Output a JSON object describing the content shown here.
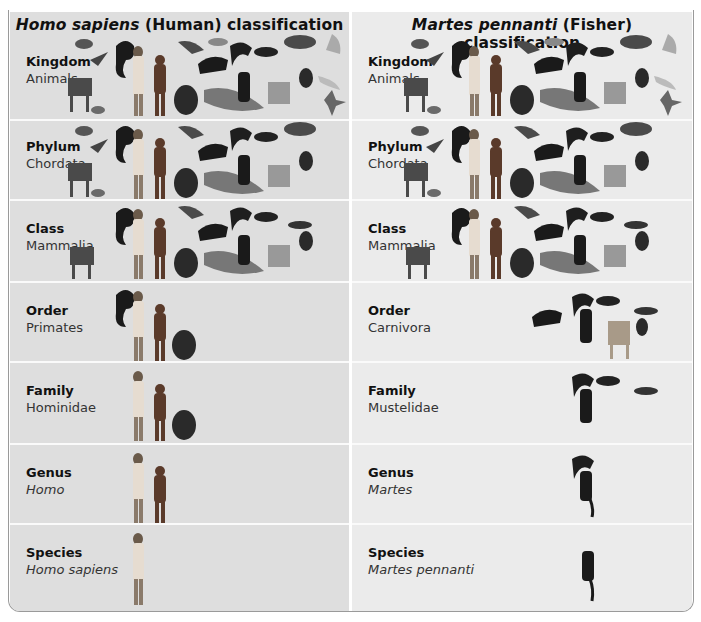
{
  "panels": [
    {
      "id": "human",
      "title_italic": "Homo sapiens",
      "title_rest": " (Human) classification",
      "background": "#dedede",
      "rows": [
        {
          "rank": "Kingdom",
          "taxon": "Animals",
          "taxon_italic": false,
          "organisms": [
            "bird",
            "gull",
            "primate-monkey",
            "human-man",
            "human-woman",
            "bat",
            "squirrel",
            "raccoon",
            "marten",
            "ferret",
            "fish",
            "jellyfish",
            "goat",
            "frog",
            "insect",
            "chimpanzee",
            "manatee",
            "fisher",
            "dog",
            "weasel",
            "cat",
            "snake",
            "starfish",
            "shell"
          ]
        },
        {
          "rank": "Phylum",
          "taxon": "Chordata",
          "taxon_italic": false,
          "organisms": [
            "bird",
            "gull",
            "primate-monkey",
            "human-man",
            "human-woman",
            "bat",
            "raccoon",
            "marten",
            "fish",
            "goat",
            "frog",
            "chimpanzee",
            "manatee",
            "fisher",
            "dog",
            "ferret",
            "weasel",
            "cat"
          ]
        },
        {
          "rank": "Class",
          "taxon": "Mammalia",
          "taxon_italic": false,
          "organisms": [
            "primate-monkey",
            "human-man",
            "human-woman",
            "bat",
            "raccoon",
            "marten",
            "goat",
            "chimpanzee",
            "manatee",
            "fisher",
            "dog",
            "ferret",
            "weasel",
            "cat"
          ]
        },
        {
          "rank": "Order",
          "taxon": "Primates",
          "taxon_italic": false,
          "organisms": [
            "primate-monkey",
            "human-man",
            "human-woman",
            "chimpanzee"
          ]
        },
        {
          "rank": "Family",
          "taxon": "Hominidae",
          "taxon_italic": false,
          "organisms": [
            "human-man",
            "human-woman",
            "chimpanzee"
          ]
        },
        {
          "rank": "Genus",
          "taxon": "Homo",
          "taxon_italic": true,
          "organisms": [
            "human-man",
            "human-woman"
          ]
        },
        {
          "rank": "Species",
          "taxon": "Homo sapiens",
          "taxon_italic": true,
          "organisms": [
            "human-man"
          ]
        }
      ]
    },
    {
      "id": "fisher",
      "title_italic": "Martes pennanti",
      "title_rest": " (Fisher) classification",
      "background": "#ebebeb",
      "rows": [
        {
          "rank": "Kingdom",
          "taxon": "Animals",
          "taxon_italic": false,
          "organisms": [
            "bird",
            "gull",
            "primate-monkey",
            "human-man",
            "human-woman",
            "bat",
            "squirrel",
            "raccoon",
            "marten",
            "ferret",
            "fish",
            "jellyfish",
            "goat",
            "frog",
            "insect",
            "chimpanzee",
            "manatee",
            "fisher",
            "dog",
            "weasel",
            "cat",
            "snake",
            "starfish",
            "shell"
          ]
        },
        {
          "rank": "Phylum",
          "taxon": "Chordata",
          "taxon_italic": false,
          "organisms": [
            "bird",
            "gull",
            "primate-monkey",
            "human-man",
            "human-woman",
            "bat",
            "raccoon",
            "marten",
            "fish",
            "goat",
            "frog",
            "chimpanzee",
            "manatee",
            "fisher",
            "dog",
            "ferret",
            "weasel",
            "cat"
          ]
        },
        {
          "rank": "Class",
          "taxon": "Mammalia",
          "taxon_italic": false,
          "organisms": [
            "primate-monkey",
            "human-man",
            "human-woman",
            "bat",
            "raccoon",
            "marten",
            "goat",
            "chimpanzee",
            "manatee",
            "fisher",
            "dog",
            "ferret",
            "weasel",
            "cat"
          ]
        },
        {
          "rank": "Order",
          "taxon": "Carnivora",
          "taxon_italic": false,
          "organisms": [
            "raccoon",
            "marten",
            "fisher",
            "ferret",
            "weasel",
            "dog",
            "cat"
          ]
        },
        {
          "rank": "Family",
          "taxon": "Mustelidae",
          "taxon_italic": false,
          "organisms": [
            "marten",
            "fisher",
            "ferret",
            "weasel"
          ]
        },
        {
          "rank": "Genus",
          "taxon": "Martes",
          "taxon_italic": true,
          "organisms": [
            "marten",
            "fisher"
          ]
        },
        {
          "rank": "Species",
          "taxon": "Martes pennanti",
          "taxon_italic": true,
          "organisms": [
            "fisher"
          ]
        }
      ]
    }
  ],
  "colors": {
    "frame_border": "#9a9a9a",
    "row_divider": "#fafafa",
    "text": "#111111",
    "taxon_text": "#333333"
  }
}
